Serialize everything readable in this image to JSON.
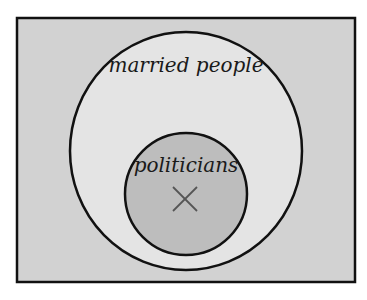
{
  "diagram": {
    "type": "venn",
    "colors": {
      "background": "#ffffff",
      "universe_fill": "#d2d2d2",
      "outer_set_fill": "#e4e4e4",
      "inner_set_fill": "#bdbdbd",
      "stroke": "#111111",
      "marker": "#555555"
    },
    "sets": [
      {
        "id": "married",
        "label": "married people"
      },
      {
        "id": "politicians",
        "label": "politicians",
        "subset_of": "married"
      }
    ],
    "marker": {
      "symbol": "×",
      "in_set": "politicians",
      "meaning": "existence-marker"
    }
  }
}
